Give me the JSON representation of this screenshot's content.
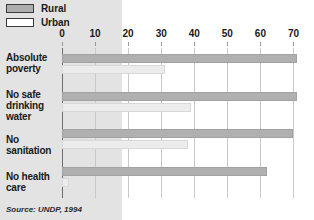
{
  "legend": {
    "position": "top-left",
    "items": [
      {
        "label": "Rural",
        "swatch": "rural-swatch",
        "color": "#aeaeae"
      },
      {
        "label": "Urban",
        "swatch": "urban-swatch",
        "color": "#ffffff"
      }
    ]
  },
  "source": {
    "text": "Source: UNDP, 1994"
  },
  "chart_data": {
    "type": "bar",
    "orientation": "horizontal",
    "title": "",
    "subtitle": "",
    "xlabel": "",
    "ylabel": "",
    "xlim": [
      0,
      75
    ],
    "xticks": [
      0,
      10,
      20,
      30,
      40,
      50,
      60,
      70
    ],
    "xtick_labels": [
      "0",
      "10",
      "20",
      "30",
      "40",
      "50",
      "60",
      "70"
    ],
    "grid": true,
    "grid_axis": "x",
    "legend_position": "top-left",
    "categories": [
      "Absolute poverty",
      "No safe drinking water",
      "No sanitation",
      "No health care"
    ],
    "series": [
      {
        "name": "Rural",
        "color": "#b0b0b0",
        "values": [
          71,
          71,
          70,
          62
        ]
      },
      {
        "name": "Urban",
        "color": "#ececec",
        "values": [
          31,
          39,
          38,
          2
        ]
      }
    ]
  }
}
